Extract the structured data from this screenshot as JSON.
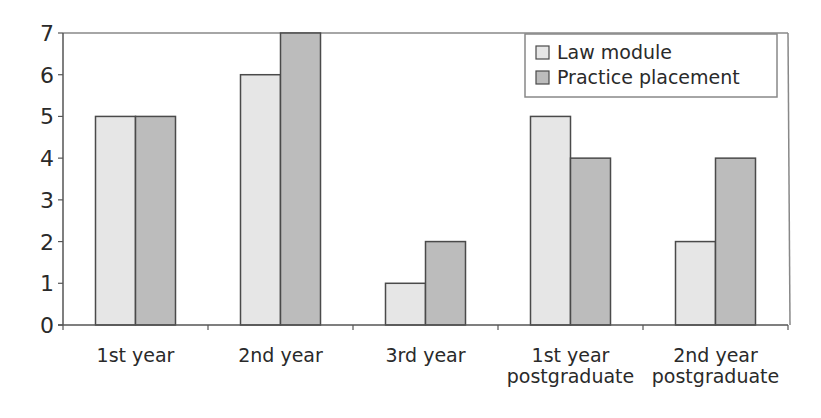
{
  "chart_data": {
    "type": "bar",
    "title": "",
    "xlabel": "",
    "ylabel": "",
    "ylim": [
      0,
      7
    ],
    "yticks": [
      0,
      1,
      2,
      3,
      4,
      5,
      6,
      7
    ],
    "grid": false,
    "legend_position": "top-right",
    "categories": [
      [
        "1st year"
      ],
      [
        "2nd year"
      ],
      [
        "3rd year"
      ],
      [
        "1st year",
        "postgraduate"
      ],
      [
        "2nd year",
        "postgraduate"
      ]
    ],
    "series": [
      {
        "name": "Law module",
        "color": "#e6e6e6",
        "values": [
          5,
          6,
          1,
          5,
          2
        ]
      },
      {
        "name": "Practice placement",
        "color": "#bcbcbc",
        "values": [
          5,
          7,
          2,
          4,
          4
        ]
      }
    ]
  },
  "colors": {
    "axis": "#555555",
    "bar_stroke": "#4a4a4a",
    "frame": "#888888"
  }
}
